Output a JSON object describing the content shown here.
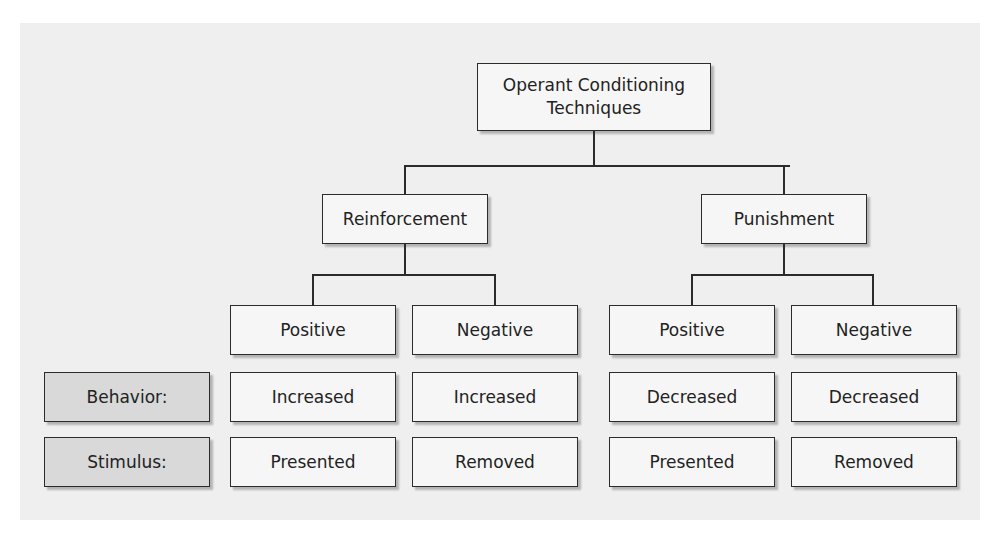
{
  "diagram": {
    "root": {
      "label": "Operant Conditioning Techniques"
    },
    "branches": [
      {
        "label": "Reinforcement",
        "children": [
          {
            "label": "Positive",
            "behavior": "Increased",
            "stimulus": "Presented"
          },
          {
            "label": "Negative",
            "behavior": "Increased",
            "stimulus": "Removed"
          }
        ]
      },
      {
        "label": "Punishment",
        "children": [
          {
            "label": "Positive",
            "behavior": "Decreased",
            "stimulus": "Presented"
          },
          {
            "label": "Negative",
            "behavior": "Decreased",
            "stimulus": "Removed"
          }
        ]
      }
    ],
    "row_labels": {
      "behavior": "Behavior:",
      "stimulus": "Stimulus:"
    }
  },
  "colors": {
    "background": "#efefef",
    "box_fill": "#f6f6f6",
    "label_box_fill": "#d9d9d9",
    "border": "#2b2b2b"
  }
}
